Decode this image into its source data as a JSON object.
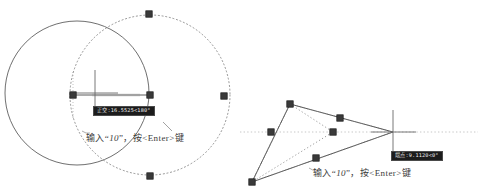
{
  "document": {
    "kind": "cad-tutorial-illustration",
    "description": "AutoCAD grip-stretch illustration: circle scaled via grip on left, polyline stretched via grip on right"
  },
  "colors": {
    "geometry": "#555555",
    "ghost": "#8a8a8a",
    "grip": "#3a3a3a",
    "grip_stroke": "#202020",
    "tooltip_bg": "#1c1c1c",
    "tooltip_text": "#eeeeee",
    "tooltip_border": "#4a4a4a",
    "caption_text": "#3c3c3c",
    "tracking": "#9a9a9a"
  },
  "left_panel": {
    "name": "circle-grip-edit",
    "tooltip": {
      "label": "正交:",
      "value": "16.5525",
      "separator": "<",
      "angle": "180°",
      "full": "正交: 16.5525 < 180°"
    },
    "caption": {
      "prefix": "输入“",
      "value": "10",
      "suffix": "”，按<Enter>键",
      "full": "输入“10”，按<Enter>键"
    },
    "original_circle": {
      "cx": 77,
      "cy": 93,
      "r": 72
    },
    "ghost_circle": {
      "cx": 150,
      "cy": 95,
      "r": 80
    },
    "grips": [
      {
        "name": "grip-base-point",
        "x": 73,
        "y": 95
      },
      {
        "name": "grip-drag-point",
        "x": 150,
        "y": 95
      },
      {
        "name": "grip-ghost-top",
        "x": 149,
        "y": 14
      },
      {
        "name": "grip-ghost-right",
        "x": 224,
        "y": 96
      },
      {
        "name": "grip-ghost-bottom",
        "x": 150,
        "y": 176
      }
    ],
    "crosshair": {
      "x": 95,
      "y": 93,
      "size": 22
    },
    "rubber_band": {
      "x1": 73,
      "y1": 95,
      "x2": 150,
      "y2": 95
    }
  },
  "right_panel": {
    "name": "polyline-grip-stretch",
    "tooltip": {
      "label": "端点:",
      "value": "9.1120",
      "separator": "<",
      "angle": "0°",
      "full": "端点: 9.1120 < 0°"
    },
    "caption": {
      "prefix": "输入“",
      "value": "10",
      "suffix": "”，按<Enter>键",
      "full": "输入“10”，按<Enter>键"
    },
    "solid_shape": [
      {
        "x": 290,
        "y": 104
      },
      {
        "x": 393,
        "y": 132
      },
      {
        "x": 252,
        "y": 182
      }
    ],
    "ghost_shape": [
      {
        "x": 290,
        "y": 104
      },
      {
        "x": 393,
        "y": 132
      },
      {
        "x": 252,
        "y": 182
      }
    ],
    "grips": [
      {
        "name": "grip-vertex-top",
        "x": 290,
        "y": 104
      },
      {
        "name": "grip-mid-upper",
        "x": 340,
        "y": 118
      },
      {
        "name": "grip-mid-left",
        "x": 271,
        "y": 132
      },
      {
        "name": "grip-endpoint",
        "x": 333,
        "y": 132
      },
      {
        "name": "grip-mid-lower",
        "x": 316,
        "y": 158
      },
      {
        "name": "grip-vertex-bottom",
        "x": 252,
        "y": 182
      }
    ],
    "crosshair": {
      "x": 393,
      "y": 132,
      "size": 22
    },
    "tracking_axis": {
      "y": 132,
      "x1": 240,
      "x2": 478
    }
  }
}
